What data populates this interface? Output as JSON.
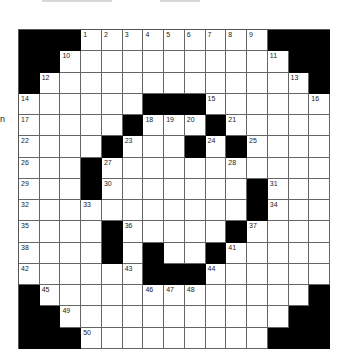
{
  "puzzle": {
    "side_label": "n",
    "rows": 15,
    "cols": 15,
    "colors": {
      "black": "#000000",
      "white": "#ffffff",
      "line": "#666666"
    },
    "grid": [
      "###.........###",
      "##...........##",
      "#.............#",
      "......###......",
      ".....#...#.....",
      "....#...#.#....",
      "...#...........",
      "...#.......#...",
      "...........#...",
      "....#.....#....",
      "....#.#..#.....",
      "......###......",
      "#.............#",
      "##...........##",
      "###.........###"
    ],
    "numbers": [
      {
        "r": 0,
        "c": 3,
        "n": "1"
      },
      {
        "r": 0,
        "c": 4,
        "n": "2"
      },
      {
        "r": 0,
        "c": 5,
        "n": "3"
      },
      {
        "r": 0,
        "c": 6,
        "n": "4"
      },
      {
        "r": 0,
        "c": 7,
        "n": "5"
      },
      {
        "r": 0,
        "c": 8,
        "n": "6"
      },
      {
        "r": 0,
        "c": 9,
        "n": "7"
      },
      {
        "r": 0,
        "c": 10,
        "n": "8"
      },
      {
        "r": 0,
        "c": 11,
        "n": "9"
      },
      {
        "r": 1,
        "c": 2,
        "n": "10"
      },
      {
        "r": 1,
        "c": 12,
        "n": "11"
      },
      {
        "r": 2,
        "c": 1,
        "n": "12"
      },
      {
        "r": 2,
        "c": 13,
        "n": "13"
      },
      {
        "r": 3,
        "c": 0,
        "n": "14"
      },
      {
        "r": 3,
        "c": 9,
        "n": "15"
      },
      {
        "r": 3,
        "c": 14,
        "n": "16"
      },
      {
        "r": 4,
        "c": 0,
        "n": "17"
      },
      {
        "r": 4,
        "c": 6,
        "n": "18"
      },
      {
        "r": 4,
        "c": 7,
        "n": "19"
      },
      {
        "r": 4,
        "c": 8,
        "n": "20"
      },
      {
        "r": 4,
        "c": 10,
        "n": "21"
      },
      {
        "r": 5,
        "c": 0,
        "n": "22"
      },
      {
        "r": 5,
        "c": 5,
        "n": "23"
      },
      {
        "r": 5,
        "c": 9,
        "n": "24"
      },
      {
        "r": 5,
        "c": 11,
        "n": "25"
      },
      {
        "r": 6,
        "c": 0,
        "n": "26"
      },
      {
        "r": 6,
        "c": 4,
        "n": "27"
      },
      {
        "r": 6,
        "c": 10,
        "n": "28"
      },
      {
        "r": 7,
        "c": 0,
        "n": "29"
      },
      {
        "r": 7,
        "c": 4,
        "n": "30"
      },
      {
        "r": 7,
        "c": 12,
        "n": "31"
      },
      {
        "r": 8,
        "c": 0,
        "n": "32"
      },
      {
        "r": 8,
        "c": 3,
        "n": "33"
      },
      {
        "r": 8,
        "c": 12,
        "n": "34"
      },
      {
        "r": 9,
        "c": 0,
        "n": "35"
      },
      {
        "r": 9,
        "c": 5,
        "n": "36"
      },
      {
        "r": 9,
        "c": 11,
        "n": "37"
      },
      {
        "r": 10,
        "c": 0,
        "n": "38"
      },
      {
        "r": 10,
        "c": 4,
        "n": "39"
      },
      {
        "r": 10,
        "c": 6,
        "n": "40"
      },
      {
        "r": 10,
        "c": 10,
        "n": "41"
      },
      {
        "r": 11,
        "c": 0,
        "n": "42"
      },
      {
        "r": 11,
        "c": 5,
        "n": "43"
      },
      {
        "r": 11,
        "c": 9,
        "n": "44"
      },
      {
        "r": 12,
        "c": 1,
        "n": "45"
      },
      {
        "r": 12,
        "c": 6,
        "n": "46"
      },
      {
        "r": 12,
        "c": 7,
        "n": "47"
      },
      {
        "r": 12,
        "c": 8,
        "n": "48"
      },
      {
        "r": 13,
        "c": 2,
        "n": "49"
      },
      {
        "r": 14,
        "c": 3,
        "n": "50"
      }
    ]
  }
}
